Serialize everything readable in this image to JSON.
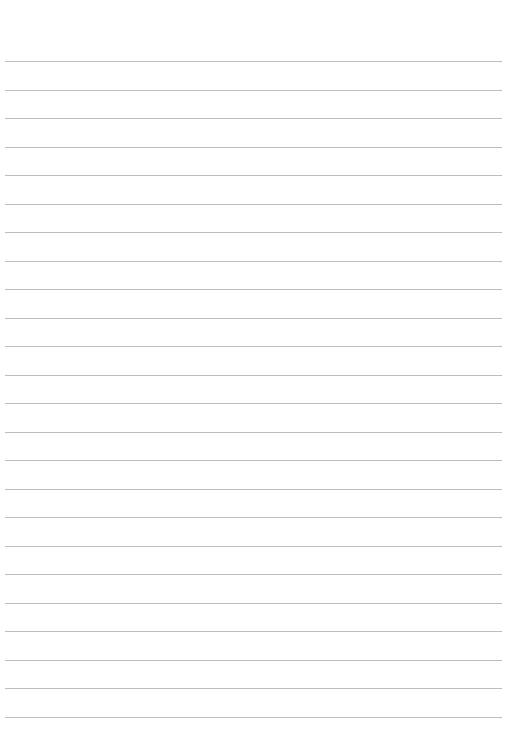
{
  "page": {
    "type": "lined-paper",
    "background_color": "#ffffff",
    "line_color": "#bdbdbd",
    "line_count": 24,
    "first_line_y": 61,
    "line_spacing": 28.5,
    "line_left": 5,
    "line_right": 502,
    "text": ""
  }
}
